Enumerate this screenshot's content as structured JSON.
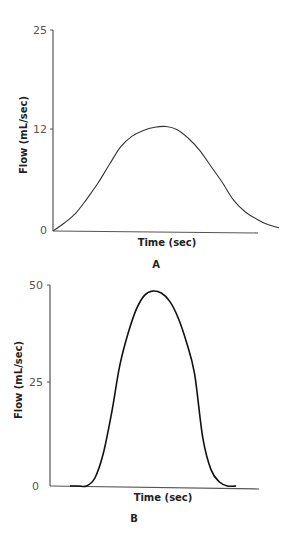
{
  "chart_data": [
    {
      "type": "line",
      "panel_label": "A",
      "title": "",
      "xlabel": "Time (sec)",
      "ylabel": "Flow (mL/sec)",
      "y_ticks": [
        "0",
        "12",
        "25"
      ],
      "ylim": [
        0,
        25
      ],
      "grid": false,
      "legend": null,
      "x": [
        0,
        0.05,
        0.1,
        0.15,
        0.2,
        0.25,
        0.3,
        0.35,
        0.4,
        0.45,
        0.5,
        0.55,
        0.6,
        0.65,
        0.7,
        0.75,
        0.8,
        0.85,
        0.9,
        0.95,
        1.0
      ],
      "values": [
        0,
        1.0,
        2.2,
        4.0,
        6.0,
        8.3,
        10.5,
        11.8,
        12.5,
        12.9,
        13.0,
        12.6,
        11.5,
        10.0,
        8.0,
        6.0,
        3.8,
        2.4,
        1.5,
        0.8,
        0.4
      ],
      "colors": {
        "line": "#333333",
        "axis": "#555555"
      }
    },
    {
      "type": "line",
      "panel_label": "B",
      "title": "",
      "xlabel": "Time (sec)",
      "ylabel": "Flow (mL/sec)",
      "y_ticks": [
        "0",
        "25",
        "50"
      ],
      "ylim": [
        0,
        50
      ],
      "grid": false,
      "legend": null,
      "x": [
        0,
        0.05,
        0.1,
        0.15,
        0.2,
        0.25,
        0.3,
        0.35,
        0.4,
        0.45,
        0.5,
        0.55,
        0.6,
        0.65,
        0.7,
        0.75,
        0.8,
        0.85,
        0.9,
        0.95,
        1.0
      ],
      "values": [
        0,
        0,
        0,
        2,
        8,
        18,
        30,
        38,
        44,
        47.5,
        48.5,
        48,
        46,
        42,
        36,
        28,
        12,
        4,
        1,
        0,
        0
      ],
      "colors": {
        "line": "#111111",
        "axis": "#555555"
      }
    }
  ]
}
